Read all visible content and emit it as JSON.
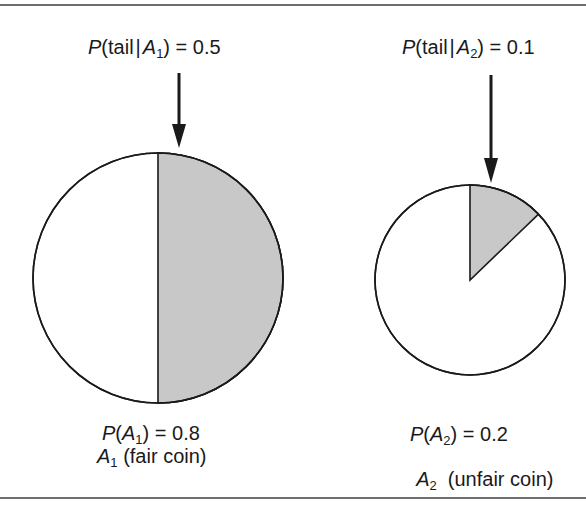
{
  "figure": {
    "left_event": {
      "conditional_label": {
        "p": "P",
        "open": "(tail",
        "bar": "|",
        "event": "A",
        "sub": "1",
        "close": ") = ",
        "value": "0.5"
      },
      "prior_label": {
        "p": "P",
        "open": "(",
        "event": "A",
        "sub": "1",
        "close": ") = ",
        "value": "0.8"
      },
      "name_label": {
        "event": "A",
        "sub": "1",
        "desc": " (fair coin)"
      },
      "prior": 0.8,
      "p_tail": 0.5
    },
    "right_event": {
      "conditional_label": {
        "p": "P",
        "open": "(tail",
        "bar": "|",
        "event": "A",
        "sub": "2",
        "close": ") = ",
        "value": "0.1"
      },
      "prior_label": {
        "p": "P",
        "open": "(",
        "event": "A",
        "sub": "2",
        "close": ") = ",
        "value": "0.2"
      },
      "name_label": {
        "event": "A",
        "sub": "2",
        "desc": "  (unfair coin)"
      },
      "prior": 0.2,
      "p_tail": 0.1
    },
    "colors": {
      "shade": "#c8c8c8",
      "stroke": "#1a1a1a",
      "background": "#ffffff",
      "rule": "#6e6e6e"
    }
  }
}
